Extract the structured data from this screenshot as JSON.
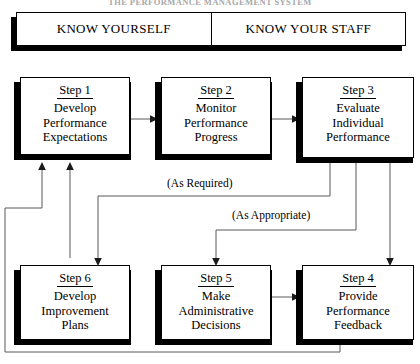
{
  "document": {
    "title": "THE PERFORMANCE MANAGEMENT SYSTEM"
  },
  "banner": {
    "left_label": "KNOW YOURSELF",
    "right_label": "KNOW YOUR STAFF"
  },
  "flowchart": {
    "type": "process-cycle",
    "nodes": [
      {
        "id": "step1",
        "label": "Step 1",
        "body": "Develop\nPerformance\nExpectations"
      },
      {
        "id": "step2",
        "label": "Step 2",
        "body": "Monitor\nPerformance\nProgress"
      },
      {
        "id": "step3",
        "label": "Step 3",
        "body": "Evaluate\nIndividual\nPerformance"
      },
      {
        "id": "step6",
        "label": "Step 6",
        "body": "Develop\nImprovement\nPlans"
      },
      {
        "id": "step5",
        "label": "Step 5",
        "body": "Make\nAdministrative\nDecisions"
      },
      {
        "id": "step4",
        "label": "Step 4",
        "body": "Provide\nPerformance\nFeedback"
      }
    ],
    "annotations": [
      {
        "id": "as-required",
        "text": "(As Required)"
      },
      {
        "id": "as-appropriate",
        "text": "(As Appropriate)"
      }
    ],
    "edges": [
      {
        "from": "step1",
        "to": "step2",
        "label": ""
      },
      {
        "from": "step2",
        "to": "step3",
        "label": ""
      },
      {
        "from": "step3",
        "to": "step6",
        "label": "(As Required)"
      },
      {
        "from": "step3",
        "to": "step5",
        "label": "(As Appropriate)"
      },
      {
        "from": "step3",
        "to": "step4",
        "label": ""
      },
      {
        "from": "step5",
        "to": "step4",
        "label": ""
      },
      {
        "from": "step6",
        "to": "step1",
        "label": ""
      },
      {
        "from": "step4",
        "to": "step1",
        "label": ""
      }
    ]
  },
  "colors": {
    "ink": "#000000",
    "wire": "#58585a",
    "paper": "#ffffff",
    "faded_title": "#a8a8a8"
  }
}
